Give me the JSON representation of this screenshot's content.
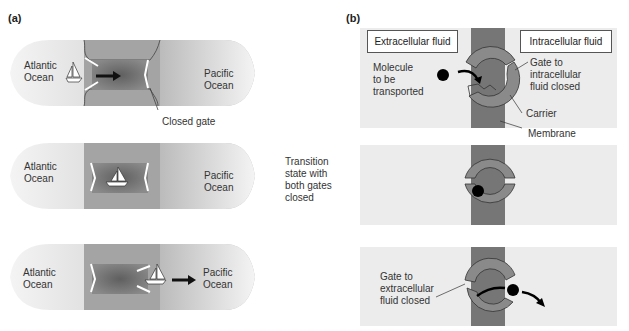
{
  "figure": {
    "panel_a": {
      "label": "(a)",
      "scenes": [
        {
          "left": "Atlantic\nOcean",
          "left_line1": "Atlantic",
          "left_line2": "Ocean",
          "right_line1": "Pacific",
          "right_line2": "Ocean",
          "callout": "Closed gate",
          "state": "left gate open, boat entering, right gate closed"
        },
        {
          "left_line1": "Atlantic",
          "left_line2": "Ocean",
          "right_line1": "Pacific",
          "right_line2": "Ocean",
          "state": "both gates closed, boat in lock"
        },
        {
          "left_line1": "Atlantic",
          "left_line2": "Ocean",
          "right_line1": "Pacific",
          "right_line2": "Ocean",
          "state": "left gate closed, right gate open, boat exiting"
        }
      ]
    },
    "middle_caption": {
      "lines": [
        "Transition",
        "state with",
        "both gates",
        "closed"
      ]
    },
    "panel_b": {
      "label": "(b)",
      "extracellular_box": "Extracellular fluid",
      "intracellular_box": "Intracellular fluid",
      "scene1": {
        "molecule_label": [
          "Molecule",
          "to be",
          "transported"
        ],
        "gate_label": [
          "Gate to",
          "intracellular",
          "fluid closed"
        ],
        "carrier_label": "Carrier",
        "membrane_label": "Membrane"
      },
      "scene3": {
        "gate_label": [
          "Gate to",
          "extracellular",
          "fluid closed"
        ]
      }
    },
    "colors": {
      "water_dark": "#6f6f6f",
      "land": "#a9a9a9",
      "ocean_fade": "#d6d6d6",
      "membrane": "#767676",
      "carrier": "#8a8a8a",
      "panel_bg": "#ececec",
      "molecule": "#000000"
    }
  }
}
